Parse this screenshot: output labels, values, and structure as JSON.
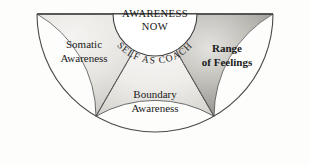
{
  "diagram": {
    "center": {
      "line1": "AWARENESS",
      "line2": "NOW"
    },
    "arc_text": "SELF AS COACH",
    "sectors": [
      {
        "id": "somatic",
        "line1": "Somatic",
        "line2": "Awareness",
        "bold": false,
        "fill_light": "#e9e8e4",
        "fill_dark": "#b9b7b1"
      },
      {
        "id": "boundary",
        "line1": "Boundary",
        "line2": "Awareness",
        "bold": false,
        "fill_light": "#f1f0ed",
        "fill_dark": "#c9c7c1"
      },
      {
        "id": "feelings",
        "line1": "Range",
        "line2": "of Feelings",
        "bold": true,
        "fill_light": "#c2c0ba",
        "fill_dark": "#8d8b86"
      }
    ],
    "colors": {
      "background": "#fdfdfc",
      "outline": "#4a4a4a",
      "divider": "#5a5a5a",
      "center_fill": "#ffffff",
      "text": "#1a1a1a"
    }
  }
}
